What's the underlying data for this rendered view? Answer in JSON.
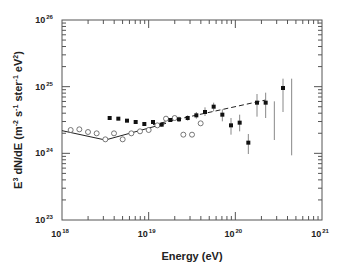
{
  "chart_data": {
    "type": "scatter",
    "title": "",
    "xlabel": "Energy  (eV)",
    "ylabel": "E3 dN/dE  (m-2 s-1 ster-1 eV2)",
    "xscale": "log",
    "yscale": "log",
    "xlim": [
      1e+18,
      1e+21
    ],
    "ylim": [
      1e+23,
      1e+26
    ],
    "x_ticks": [
      {
        "base": "10",
        "exp": "18",
        "log": 18
      },
      {
        "base": "10",
        "exp": "19",
        "log": 19
      },
      {
        "base": "10",
        "exp": "20",
        "log": 20
      },
      {
        "base": "10",
        "exp": "21",
        "log": 21
      }
    ],
    "y_ticks": [
      {
        "base": "10",
        "exp": "23",
        "log": 23
      },
      {
        "base": "10",
        "exp": "24",
        "log": 24
      },
      {
        "base": "10",
        "exp": "25",
        "log": 25
      },
      {
        "base": "10",
        "exp": "26",
        "log": 26
      }
    ],
    "grid": false,
    "legend": null,
    "series": [
      {
        "name": "open circles",
        "marker": "open-circle",
        "color": "#555555",
        "points_log": [
          [
            18.1,
            24.35
          ],
          [
            18.2,
            24.36
          ],
          [
            18.3,
            24.32
          ],
          [
            18.4,
            24.3
          ],
          [
            18.5,
            24.21
          ],
          [
            18.6,
            24.3
          ],
          [
            18.7,
            24.21
          ],
          [
            18.8,
            24.3
          ],
          [
            18.9,
            24.33
          ],
          [
            19.0,
            24.35
          ],
          [
            19.1,
            24.42
          ],
          [
            19.2,
            24.52
          ],
          [
            19.3,
            24.53
          ],
          [
            19.4,
            24.28
          ],
          [
            19.5,
            24.28
          ],
          [
            19.6,
            24.45
          ]
        ]
      },
      {
        "name": "filled squares with error bars",
        "marker": "filled-square",
        "color": "#111111",
        "points_log": [
          {
            "x": 18.55,
            "y": 24.53,
            "lo": 24.53,
            "hi": 24.53
          },
          {
            "x": 18.65,
            "y": 24.52,
            "lo": 24.52,
            "hi": 24.52
          },
          {
            "x": 18.75,
            "y": 24.49,
            "lo": 24.49,
            "hi": 24.49
          },
          {
            "x": 18.85,
            "y": 24.47,
            "lo": 24.47,
            "hi": 24.47
          },
          {
            "x": 18.95,
            "y": 24.44,
            "lo": 24.44,
            "hi": 24.44
          },
          {
            "x": 19.05,
            "y": 24.47,
            "lo": 24.44,
            "hi": 24.5
          },
          {
            "x": 19.15,
            "y": 24.43,
            "lo": 24.4,
            "hi": 24.46
          },
          {
            "x": 19.25,
            "y": 24.5,
            "lo": 24.47,
            "hi": 24.53
          },
          {
            "x": 19.35,
            "y": 24.51,
            "lo": 24.47,
            "hi": 24.55
          },
          {
            "x": 19.45,
            "y": 24.53,
            "lo": 24.49,
            "hi": 24.57
          },
          {
            "x": 19.55,
            "y": 24.57,
            "lo": 24.52,
            "hi": 24.62
          },
          {
            "x": 19.65,
            "y": 24.62,
            "lo": 24.56,
            "hi": 24.69
          },
          {
            "x": 19.75,
            "y": 24.7,
            "lo": 24.63,
            "hi": 24.76
          },
          {
            "x": 19.85,
            "y": 24.58,
            "lo": 24.48,
            "hi": 24.66
          },
          {
            "x": 19.95,
            "y": 24.42,
            "lo": 24.28,
            "hi": 24.53
          },
          {
            "x": 20.05,
            "y": 24.46,
            "lo": 24.33,
            "hi": 24.58
          },
          {
            "x": 20.15,
            "y": 24.16,
            "lo": 23.99,
            "hi": 24.29
          },
          {
            "x": 20.25,
            "y": 24.76,
            "lo": 24.55,
            "hi": 24.89
          },
          {
            "x": 20.35,
            "y": 24.76,
            "lo": 24.53,
            "hi": 24.91
          },
          {
            "x": 20.45,
            "y": null,
            "lo": 24.2,
            "hi": 24.78
          },
          {
            "x": 20.55,
            "y": 24.98,
            "lo": 24.62,
            "hi": 25.12
          },
          {
            "x": 20.65,
            "y": null,
            "lo": 23.97,
            "hi": 25.12
          }
        ]
      },
      {
        "name": "solid line fit",
        "style": "solid",
        "color": "#222222",
        "points_log": [
          [
            18.0,
            24.34
          ],
          [
            18.5,
            24.2
          ],
          [
            19.2,
            24.45
          ]
        ]
      },
      {
        "name": "dashed line fit",
        "style": "dashed",
        "color": "#222222",
        "points_log": [
          [
            19.05,
            24.43
          ],
          [
            20.35,
            24.8
          ]
        ]
      }
    ]
  }
}
